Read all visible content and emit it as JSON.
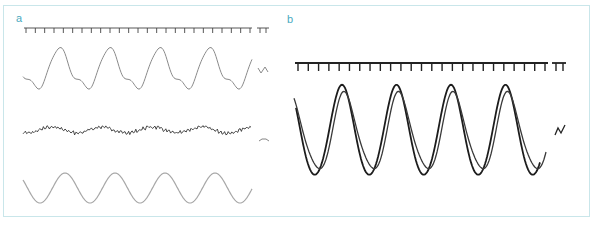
{
  "figure": {
    "panels": [
      {
        "label": "a",
        "traces": [
          "distorted-periodic-trace",
          "noisy-trace",
          "reference-sine-trace"
        ],
        "time_axis_ticks": 24,
        "calibration_marks": [
          "TT",
          "V-shape",
          "tilde"
        ]
      },
      {
        "label": "b",
        "traces": [
          "overlaid-periodic-trace-1",
          "overlaid-periodic-trace-2"
        ],
        "time_axis_ticks": 24,
        "calibration_marks": [
          "TT",
          "V-shape"
        ]
      }
    ],
    "colors": {
      "label": "#4aa9c0",
      "border": "#c9e6ea",
      "trace_light": "#8c8c8c",
      "trace_dark": "#222222",
      "axis": "#333333"
    }
  },
  "chart_data": [
    {
      "type": "line",
      "title": "a",
      "xlabel": "",
      "ylabel": "",
      "grid": false,
      "series": [
        {
          "name": "distorted periodic signal",
          "cycles": 4.5,
          "peaks_x_px": [
            60,
            108,
            160,
            210
          ],
          "troughs_x_px": [
            38,
            88,
            137,
            187,
            237
          ]
        },
        {
          "name": "noisy low-amplitude signal",
          "cycles": 4.5
        },
        {
          "name": "pure sine reference",
          "cycles": 4.5,
          "peaks_x_px": [
            65,
            113,
            165,
            215
          ],
          "troughs_x_px": [
            41,
            90,
            140,
            190,
            240
          ]
        }
      ]
    },
    {
      "type": "line",
      "title": "b",
      "xlabel": "",
      "ylabel": "",
      "grid": false,
      "series": [
        {
          "name": "overlaid signal (higher amplitude)",
          "cycles": 4.5,
          "peaks_x_px": [
            342,
            396,
            451,
            505
          ],
          "troughs_x_px": [
            315,
            368,
            423,
            478,
            532
          ]
        },
        {
          "name": "overlaid signal (lower amplitude)",
          "cycles": 4.5,
          "peaks_x_px": [
            344,
            398,
            453,
            508
          ],
          "troughs_x_px": [
            312,
            366,
            420,
            476,
            530
          ]
        }
      ]
    }
  ]
}
